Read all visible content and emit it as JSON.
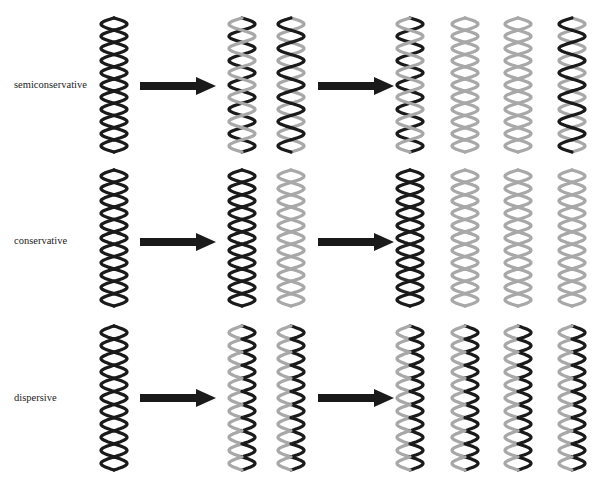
{
  "colors": {
    "parental_strand": "#1a1a1a",
    "new_strand": "#a8a8a8",
    "arrow": "#1a1a1a"
  },
  "generations": [
    "parent",
    "first-generation",
    "second-generation"
  ],
  "rows": [
    {
      "label": "semiconservative",
      "parent": [
        [
          "old",
          "old"
        ]
      ],
      "gen1": [
        [
          "old",
          "new"
        ],
        [
          "new",
          "old"
        ]
      ],
      "gen2": [
        [
          "old",
          "new"
        ],
        [
          "new",
          "new"
        ],
        [
          "new",
          "new"
        ],
        [
          "new",
          "old"
        ]
      ]
    },
    {
      "label": "conservative",
      "parent": [
        [
          "old",
          "old"
        ]
      ],
      "gen1": [
        [
          "old",
          "old"
        ],
        [
          "new",
          "new"
        ]
      ],
      "gen2": [
        [
          "old",
          "old"
        ],
        [
          "new",
          "new"
        ],
        [
          "new",
          "new"
        ],
        [
          "new",
          "new"
        ]
      ]
    },
    {
      "label": "dispersive",
      "parent": [
        [
          "old",
          "old"
        ]
      ],
      "gen1": [
        [
          "mixed",
          "mixed"
        ],
        [
          "mixed",
          "mixed"
        ]
      ],
      "gen2": [
        [
          "mixed",
          "mixed"
        ],
        [
          "mixed",
          "mixed"
        ],
        [
          "mixed",
          "mixed"
        ],
        [
          "mixed",
          "mixed"
        ]
      ]
    }
  ]
}
